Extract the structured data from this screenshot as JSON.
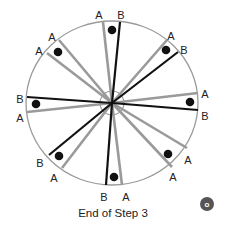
{
  "diagram": {
    "caption": "End of Step 3",
    "colors": {
      "circle": "#9a9a9a",
      "gray_line": "#9a9a9a",
      "black_line": "#111111",
      "dot": "#111111",
      "label": "#222222",
      "badge": "#555555"
    },
    "center": {
      "x": 112,
      "y": 103
    },
    "outer_circle": {
      "rx": 86,
      "ry": 82
    },
    "inner_circle": {
      "r": 12
    },
    "sectors": [
      {
        "name": "top",
        "line1": {
          "label": "A",
          "type": "gray",
          "end": [
            103,
            22
          ],
          "label_pos": [
            99,
            15
          ]
        },
        "line2": {
          "label": "B",
          "type": "black",
          "end": [
            120,
            22
          ],
          "label_pos": [
            121,
            15
          ]
        },
        "dot": [
          112,
          30
        ]
      },
      {
        "name": "top-right",
        "line1": {
          "label": "A",
          "type": "gray",
          "end": [
            167,
            40
          ],
          "label_pos": [
            171,
            36
          ]
        },
        "line2": {
          "label": "B",
          "type": "black",
          "end": [
            178,
            52
          ],
          "label_pos": [
            184,
            50
          ]
        },
        "dot": [
          166,
          50
        ]
      },
      {
        "name": "right",
        "line1": {
          "label": "A",
          "type": "gray",
          "end": [
            198,
            93
          ],
          "label_pos": [
            205,
            94
          ]
        },
        "line2": {
          "label": "B",
          "type": "black",
          "end": [
            198,
            110
          ],
          "label_pos": [
            205,
            116
          ]
        },
        "dot": [
          190,
          102
        ]
      },
      {
        "name": "bottom-right",
        "line1": {
          "label": "A",
          "type": "gray",
          "end": [
            187,
            148
          ],
          "label_pos": [
            188,
            160
          ]
        },
        "line2": {
          "label": "A",
          "type": "gray",
          "end": [
            172,
            167
          ],
          "label_pos": [
            173,
            177
          ]
        },
        "dot": [
          168,
          154
        ]
      },
      {
        "name": "bottom",
        "line1": {
          "label": "B",
          "type": "black",
          "end": [
            106,
            185
          ],
          "label_pos": [
            104,
            197
          ]
        },
        "line2": {
          "label": "A",
          "type": "gray",
          "end": [
            122,
            185
          ],
          "label_pos": [
            126,
            197
          ]
        },
        "dot": [
          114,
          177
        ]
      },
      {
        "name": "bottom-left",
        "line1": {
          "label": "B",
          "type": "black",
          "end": [
            49,
            155
          ],
          "label_pos": [
            40,
            163
          ]
        },
        "line2": {
          "label": "A",
          "type": "gray",
          "end": [
            62,
            168
          ],
          "label_pos": [
            54,
            178
          ]
        },
        "dot": [
          59,
          156
        ]
      },
      {
        "name": "left",
        "line1": {
          "label": "B",
          "type": "black",
          "end": [
            27,
            97
          ],
          "label_pos": [
            20,
            99
          ]
        },
        "line2": {
          "label": "A",
          "type": "gray",
          "end": [
            27,
            112
          ],
          "label_pos": [
            20,
            118
          ]
        },
        "dot": [
          36,
          104
        ]
      },
      {
        "name": "top-left",
        "line1": {
          "label": "A",
          "type": "gray",
          "end": [
            47,
            53
          ],
          "label_pos": [
            39,
            51
          ]
        },
        "line2": {
          "label": "A",
          "type": "gray",
          "end": [
            59,
            40
          ],
          "label_pos": [
            52,
            37
          ]
        },
        "dot": [
          58,
          52
        ]
      }
    ],
    "badge": {
      "label": "o",
      "x": 207,
      "y": 204,
      "r": 7
    }
  }
}
